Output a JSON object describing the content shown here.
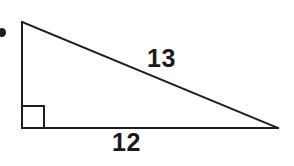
{
  "figure": {
    "kind": "right-triangle-diagram",
    "background_color": "#ffffff",
    "stroke_color": "#1f1f1f",
    "text_color": "#1a1a1a",
    "bullet": {
      "name": "list-bullet-dot",
      "color": "#1f1f1f",
      "cx": 2,
      "cy": 32.5,
      "rx": 4,
      "ry": 4.5
    },
    "triangle": {
      "vertices": {
        "apex": {
          "x": 22,
          "y": 22
        },
        "right_angle": {
          "x": 22,
          "y": 128
        },
        "base_right": {
          "x": 278,
          "y": 128
        }
      },
      "stroke_width": 2
    },
    "right_angle_marker": {
      "x": 22,
      "y": 106,
      "size": 22,
      "stroke_width": 2
    },
    "labels": {
      "hypotenuse": "13",
      "base": "12"
    }
  }
}
